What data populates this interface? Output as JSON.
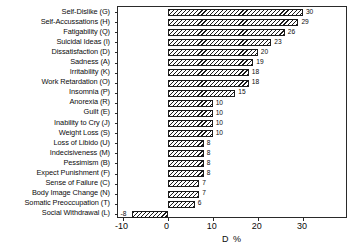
{
  "chart_data": {
    "type": "bar",
    "orientation": "horizontal",
    "title": "",
    "subtitle": "",
    "xlabel": "D %",
    "ylabel": "",
    "xlim": [
      -11,
      40
    ],
    "xticks": [
      -10,
      0,
      10,
      20,
      30
    ],
    "xticklabels": [
      "-10",
      "0",
      "10",
      "20",
      "30"
    ],
    "grid": false,
    "legend": null,
    "categories": [
      "Self-Dislike (G)",
      "Self-Accussations (H)",
      "Fatigability (Q)",
      "Suicidal Ideas (I)",
      "Dissatisfaction (D)",
      "Sadness (A)",
      "Irritability (K)",
      "Work Retardation (O)",
      "Insomnia (P)",
      "Anorexia (R)",
      "Guilt (E)",
      "Inability to Cry (J)",
      "Weight Loss (S)",
      "Loss of Libido (U)",
      "Indecisiveness (M)",
      "Pessimism (B)",
      "Expect Punishment (F)",
      "Sense of Failure (C)",
      "Body Image Change (N)",
      "Somatic Preoccupation (T)",
      "Social Withdrawal (L)"
    ],
    "values": [
      30,
      29,
      26,
      23,
      20,
      19,
      18,
      18,
      15,
      10,
      10,
      10,
      10,
      8,
      8,
      8,
      8,
      7,
      7,
      6,
      4
    ],
    "value_labels": [
      "30",
      "29",
      "26",
      "23",
      "20",
      "19",
      "18",
      "18",
      "15",
      "10",
      "10",
      "10",
      "10",
      "8",
      "8",
      "8",
      "8",
      "7",
      "7",
      "6",
      "4"
    ],
    "extra_series_note": "",
    "negative_bar": {
      "category": "Social Withdrawal (L)",
      "value": -8,
      "label": "-8"
    }
  }
}
